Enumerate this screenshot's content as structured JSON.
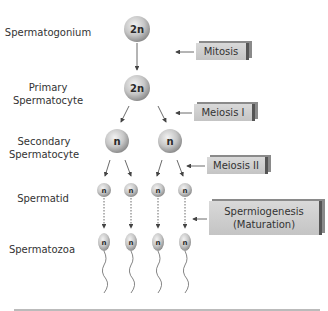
{
  "stages": {
    "spermatogonium": "Spermatogonium",
    "primary": [
      "Primary",
      "Spermatocyte"
    ],
    "secondary": [
      "Secondary",
      "Spermatocyte"
    ],
    "spermatid": "Spermatid",
    "spermatozoa": "Spermatozoa"
  },
  "processes": {
    "mitosis": "Mitosis",
    "meiosis1": "Meiosis I",
    "meiosis2": "Meiosis II",
    "spermiogenesis": [
      "Spermiogenesis",
      "(Maturation)"
    ]
  },
  "ploidy": {
    "diploid": "2n",
    "haploid": "n"
  },
  "colors": {
    "sphere_light": "#eeeeee",
    "sphere_dark": "#9a9a9a",
    "box": "#cfcfcf",
    "arrow": "#444444"
  }
}
